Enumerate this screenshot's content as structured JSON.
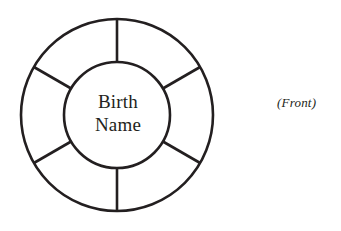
{
  "diagram": {
    "title_text": "",
    "hub": {
      "line1": "Birth",
      "line2": "Name"
    },
    "caption": "(Front)",
    "segments": [
      {
        "index": 1,
        "label": ""
      },
      {
        "index": 2,
        "label": ""
      },
      {
        "index": 3,
        "label": ""
      },
      {
        "index": 4,
        "label": ""
      },
      {
        "index": 5,
        "label": ""
      },
      {
        "index": 6,
        "label": ""
      }
    ],
    "geometry": {
      "center_x": 117,
      "center_y": 115,
      "outer_radius": 96,
      "inner_radius": 53,
      "segment_count": 6,
      "spoke_angles_deg": [
        90,
        150,
        210,
        270,
        330,
        30
      ]
    },
    "colors": {
      "stroke": "#231f20",
      "background": "#ffffff",
      "text": "#231f20"
    }
  }
}
